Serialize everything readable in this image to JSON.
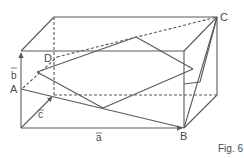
{
  "figure": {
    "caption": "Fig. 6",
    "points": {
      "A": "A",
      "B": "B",
      "C": "C",
      "D": "D"
    },
    "vectors": {
      "a": "a",
      "b": "b",
      "c": "c"
    },
    "colors": {
      "line": "#5a5a5a",
      "text": "#4a4a4a"
    }
  }
}
